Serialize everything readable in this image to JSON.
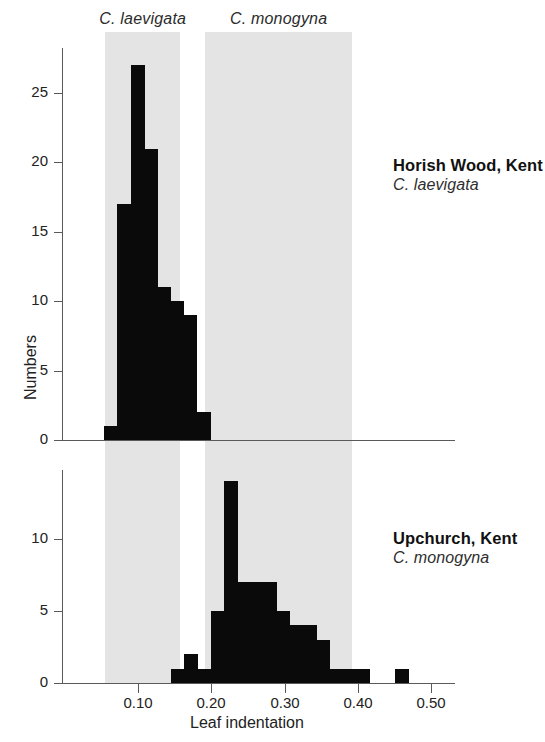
{
  "figure": {
    "band_labels": [
      {
        "text": "C. laevigata",
        "x": 0.055,
        "x_end": 0.158
      },
      {
        "text": "C. monogyna",
        "x": 0.192,
        "x_end": 0.392
      }
    ],
    "xlabel": "Leaf indentation",
    "ylabel": "Numbers",
    "x_ticks": [
      "0.10",
      "0.20",
      "0.30",
      "0.40",
      "0.50"
    ],
    "x_tick_values": [
      0.1,
      0.2,
      0.3,
      0.4,
      0.5
    ],
    "colors": {
      "bar": "#0a0a0a",
      "band": "#e4e4e4",
      "axis": "#5a5a5a",
      "text": "#1a1a1a"
    },
    "panels": [
      {
        "site": "Horish Wood, Kent",
        "species": "C. laevigata",
        "y_ticks": [
          "0",
          "5",
          "10",
          "15",
          "20",
          "25"
        ],
        "y_tick_values": [
          0,
          5,
          10,
          15,
          20,
          25
        ]
      },
      {
        "site": "Upchurch, Kent",
        "species": "C. monogyna",
        "y_ticks": [
          "0",
          "5",
          "10"
        ],
        "y_tick_values": [
          0,
          5,
          10
        ]
      }
    ]
  },
  "chart_data": [
    {
      "type": "bar",
      "title": "Horish Wood, Kent",
      "subtitle": "C. laevigata",
      "xlabel": "Leaf indentation",
      "ylabel": "Numbers",
      "xlim": [
        0.03,
        0.53
      ],
      "ylim": [
        0,
        28
      ],
      "bin_width": 0.018,
      "grid": false,
      "bin_starts": [
        0.054,
        0.072,
        0.09,
        0.108,
        0.126,
        0.144,
        0.162,
        0.18
      ],
      "categories": [
        "0.054",
        "0.072",
        "0.090",
        "0.108",
        "0.126",
        "0.144",
        "0.162",
        "0.180"
      ],
      "values": [
        1,
        17,
        27,
        21,
        11,
        10,
        9,
        2
      ],
      "tail_bins": [
        {
          "start": 0.18,
          "value": 1
        }
      ]
    },
    {
      "type": "bar",
      "title": "Upchurch, Kent",
      "subtitle": "C. monogyna",
      "xlabel": "Leaf indentation",
      "ylabel": "Numbers",
      "xlim": [
        0.03,
        0.53
      ],
      "ylim": [
        0,
        15
      ],
      "bin_width": 0.018,
      "grid": false,
      "bin_starts": [
        0.145,
        0.163,
        0.181,
        0.199,
        0.217,
        0.235,
        0.253,
        0.271,
        0.289,
        0.307,
        0.325,
        0.343,
        0.361,
        0.379,
        0.397,
        0.451
      ],
      "categories": [
        "0.145",
        "0.163",
        "0.181",
        "0.199",
        "0.217",
        "0.235",
        "0.253",
        "0.271",
        "0.289",
        "0.307",
        "0.325",
        "0.343",
        "0.361",
        "0.379",
        "0.397",
        "0.451"
      ],
      "values": [
        1,
        2,
        1,
        5,
        14,
        7,
        7,
        7,
        5,
        4,
        4,
        3,
        1,
        1,
        1,
        1
      ]
    }
  ]
}
